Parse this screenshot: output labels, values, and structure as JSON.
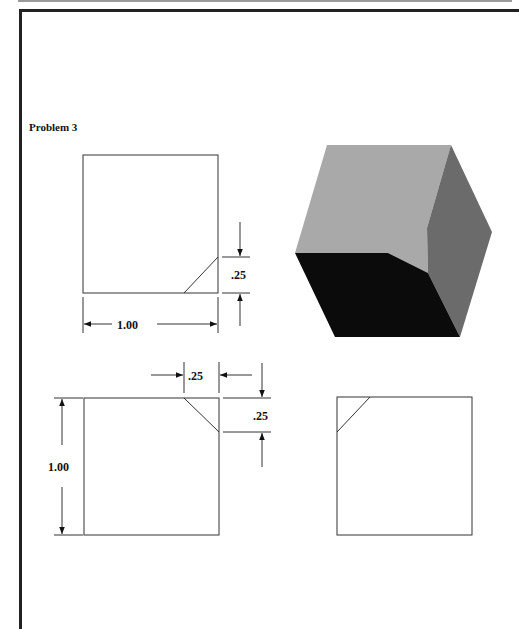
{
  "page": {
    "problem_title": "Problem 3"
  },
  "front_view": {
    "width_dim": "1.00",
    "chamfer_height_dim": ".25"
  },
  "top_view": {
    "chamfer_width_dim": ".25",
    "chamfer_depth_dim": ".25",
    "height_dim": "1.00"
  },
  "isometric_view": {
    "faces": {
      "top": "#a8a8a8",
      "right": "#6a6a6a",
      "front": "#0a0a0a",
      "chamfer": "#9a9a9a"
    }
  }
}
